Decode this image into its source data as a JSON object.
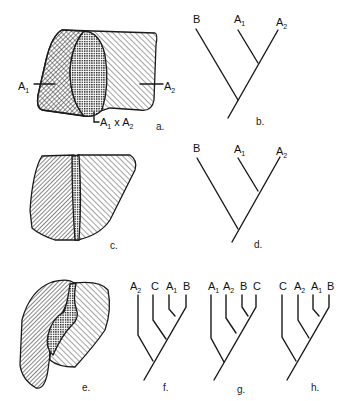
{
  "figure": {
    "panels": {
      "a": {
        "caption": "a.",
        "label_left": "A1",
        "label_right": "A2",
        "label_overlap": "A1 x A2"
      },
      "b": {
        "caption": "b.",
        "taxa": [
          "B",
          "A1",
          "A2"
        ]
      },
      "c": {
        "caption": "c."
      },
      "d": {
        "caption": "d.",
        "taxa": [
          "B",
          "A1",
          "A2"
        ]
      },
      "e": {
        "caption": "e."
      },
      "f": {
        "caption": "f.",
        "taxa": [
          "A2",
          "C",
          "A1",
          "B"
        ]
      },
      "g": {
        "caption": "g.",
        "taxa": [
          "A1",
          "A2",
          "B",
          "C"
        ]
      },
      "h": {
        "caption": "h.",
        "taxa": [
          "C",
          "A2",
          "A1",
          "B"
        ]
      }
    },
    "colors": {
      "ink": "#1a1a1a",
      "background": "#ffffff"
    }
  }
}
